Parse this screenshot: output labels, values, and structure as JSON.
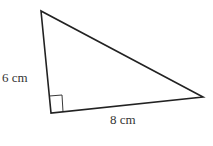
{
  "diagram": {
    "type": "right-triangle",
    "vertices": {
      "top": [
        41,
        11
      ],
      "right_angle": [
        51,
        113
      ],
      "right": [
        203,
        97
      ]
    },
    "labels": {
      "vertical_leg": "6 cm",
      "horizontal_leg": "8 cm"
    },
    "colors": {
      "stroke": "#222222",
      "text": "#333333",
      "background": "#ffffff"
    }
  }
}
